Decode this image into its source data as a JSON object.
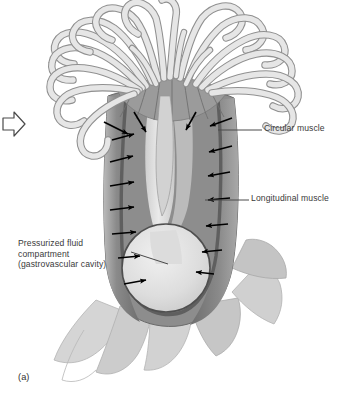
{
  "figure": {
    "caption": "(a)",
    "organism": "sea-anemone-cross-section",
    "background_color": "#ffffff"
  },
  "labels": {
    "circular_muscle": "Circular muscle",
    "longitudinal_muscle": "Longitudinal muscle",
    "pressurized_fluid": "Pressurized fluid compartment (gastrovascular cavity)"
  },
  "icons": {
    "left_arrow_marker": "arrow-right-outline-icon"
  },
  "colors": {
    "tentacle_fill": "#e4e4e4",
    "tentacle_stroke": "#8f8f8f",
    "body_wall_dark": "#777777",
    "body_wall_mid": "#9a9a9a",
    "cavity_light": "#d8d8d8",
    "pedal_disc": "#c9c9c9",
    "arrow_black": "#000000",
    "leader_line": "#4a4a4a",
    "text": "#3a3a3a"
  },
  "structures": [
    {
      "name": "tentacle-crown",
      "count": 22,
      "description": "radiating curved tentacles"
    },
    {
      "name": "oral-disc",
      "description": "fan of radial septa below tentacle bases"
    },
    {
      "name": "body-column",
      "description": "cylindrical column with muscular wall"
    },
    {
      "name": "gastrovascular-cavity",
      "description": "light pressurized fluid compartment"
    },
    {
      "name": "pedal-disc",
      "description": "spreading basal lobes"
    }
  ],
  "arrows": {
    "description": "inward-pointing black pressure arrows along body wall",
    "left_count": 7,
    "right_count": 7
  }
}
